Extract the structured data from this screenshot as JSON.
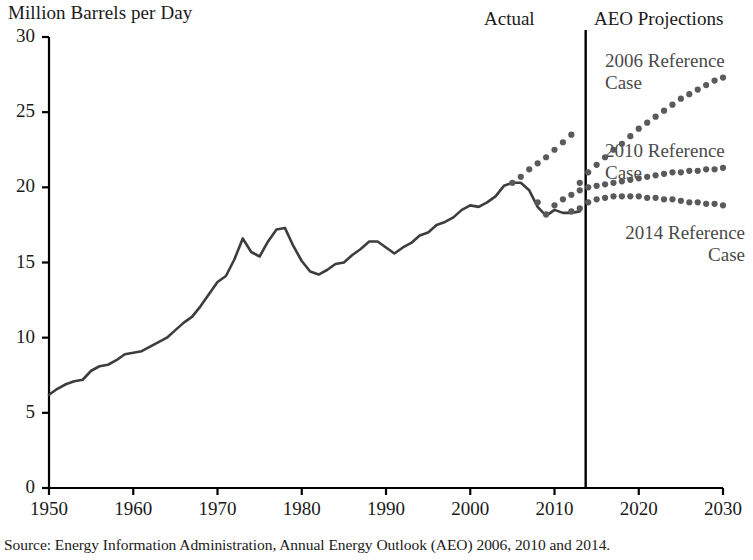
{
  "figure": {
    "y_axis_title": "Million Barrels per Day",
    "source_note": "Source: Energy Information Administration, Annual Energy Outlook (AEO) 2006, 2010 and 2014.",
    "region_labels": {
      "actual": "Actual",
      "projections": "AEO Projections"
    },
    "series_labels": {
      "ref2006": "2006 Reference\nCase",
      "ref2010": "2010 Reference\nCase",
      "ref2014": "2014 Reference\nCase"
    },
    "colors": {
      "actual_line": "#3d3d3d",
      "projection_dots": "#5a5a5a",
      "axis": "#000000",
      "divider": "#000000",
      "label_text": "#1a1a1a",
      "series_label_text": "#4a4a4a"
    }
  },
  "chart_data": {
    "type": "line",
    "title": "",
    "subtitle": "",
    "xlabel": "",
    "ylabel": "Million Barrels per Day",
    "xlim": [
      1950,
      2030
    ],
    "ylim": [
      0,
      30
    ],
    "xticks": [
      1950,
      1960,
      1970,
      1980,
      1990,
      2000,
      2010,
      2020,
      2030
    ],
    "yticks": [
      0,
      5,
      10,
      15,
      20,
      25,
      30
    ],
    "grid": false,
    "legend_position": "inline-annotations",
    "annotations": [
      {
        "text": "Actual",
        "x": 2002,
        "y": 30.5
      },
      {
        "text": "AEO Projections",
        "x": 2021,
        "y": 30.5
      },
      {
        "text": "2006 Reference Case",
        "x": 2017,
        "y": 28.0
      },
      {
        "text": "2010 Reference Case",
        "x": 2017,
        "y": 21.7
      },
      {
        "text": "2014 Reference Case",
        "x": 2023,
        "y": 16.2
      }
    ],
    "divider_year": 2013.7,
    "series": [
      {
        "name": "Actual",
        "style": "solid",
        "x": [
          1950,
          1951,
          1952,
          1953,
          1954,
          1955,
          1956,
          1957,
          1958,
          1959,
          1960,
          1961,
          1962,
          1963,
          1964,
          1965,
          1966,
          1967,
          1968,
          1969,
          1970,
          1971,
          1972,
          1973,
          1974,
          1975,
          1976,
          1977,
          1978,
          1979,
          1980,
          1981,
          1982,
          1983,
          1984,
          1985,
          1986,
          1987,
          1988,
          1989,
          1990,
          1991,
          1992,
          1993,
          1994,
          1995,
          1996,
          1997,
          1998,
          1999,
          2000,
          2001,
          2002,
          2003,
          2004,
          2005,
          2006,
          2007,
          2008,
          2009,
          2010,
          2011,
          2012,
          2013
        ],
        "values": [
          6.2,
          6.6,
          6.9,
          7.1,
          7.2,
          7.8,
          8.1,
          8.2,
          8.5,
          8.9,
          9.0,
          9.1,
          9.4,
          9.7,
          10.0,
          10.5,
          11.0,
          11.4,
          12.1,
          12.9,
          13.7,
          14.1,
          15.2,
          16.6,
          15.7,
          15.4,
          16.4,
          17.2,
          17.3,
          16.1,
          15.1,
          14.4,
          14.2,
          14.5,
          14.9,
          15.0,
          15.5,
          15.9,
          16.4,
          16.4,
          16.0,
          15.6,
          16.0,
          16.3,
          16.8,
          17.0,
          17.5,
          17.7,
          18.0,
          18.5,
          18.8,
          18.7,
          19.0,
          19.4,
          20.1,
          20.3,
          20.3,
          19.8,
          18.7,
          18.1,
          18.5,
          18.3,
          18.3,
          18.4
        ]
      },
      {
        "name": "2006 Reference Case",
        "style": "dotted",
        "x": [
          2013,
          2014,
          2015,
          2016,
          2017,
          2018,
          2019,
          2020,
          2021,
          2022,
          2023,
          2024,
          2025,
          2026,
          2027,
          2028,
          2029,
          2030
        ],
        "values": [
          20.3,
          21.0,
          21.5,
          22.0,
          22.5,
          22.9,
          23.4,
          23.9,
          24.3,
          24.7,
          25.1,
          25.5,
          25.9,
          26.2,
          26.5,
          26.8,
          27.1,
          27.3
        ]
      },
      {
        "name": "2010 Reference Case",
        "style": "dotted",
        "x": [
          2008,
          2009,
          2010,
          2011,
          2012,
          2013,
          2014,
          2015,
          2016,
          2017,
          2018,
          2019,
          2020,
          2021,
          2022,
          2023,
          2024,
          2025,
          2026,
          2027,
          2028,
          2029,
          2030
        ],
        "values": [
          19.0,
          18.2,
          18.8,
          19.2,
          19.5,
          19.8,
          20.0,
          20.1,
          20.2,
          20.3,
          20.4,
          20.5,
          20.6,
          20.7,
          20.8,
          20.9,
          21.0,
          21.0,
          21.1,
          21.1,
          21.2,
          21.2,
          21.3
        ]
      },
      {
        "name": "2014 Reference Case",
        "style": "dotted",
        "x": [
          2012,
          2013,
          2014,
          2015,
          2016,
          2017,
          2018,
          2019,
          2020,
          2021,
          2022,
          2023,
          2024,
          2025,
          2026,
          2027,
          2028,
          2029,
          2030
        ],
        "values": [
          18.4,
          18.6,
          19.0,
          19.2,
          19.3,
          19.4,
          19.4,
          19.4,
          19.4,
          19.3,
          19.3,
          19.2,
          19.2,
          19.1,
          19.0,
          19.0,
          18.9,
          18.9,
          18.8
        ]
      },
      {
        "name": "2006 Reference Case early",
        "style": "dotted",
        "x": [
          2005,
          2006,
          2007,
          2008,
          2009,
          2010,
          2011,
          2012
        ],
        "values": [
          20.3,
          20.7,
          21.2,
          21.6,
          22.0,
          22.5,
          23.0,
          23.5
        ]
      }
    ]
  }
}
